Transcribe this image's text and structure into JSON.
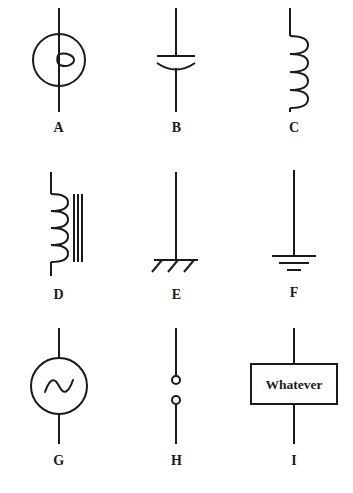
{
  "sheet": {
    "title": "Electrical schematic symbols reference sheet",
    "background_color": "#ffffff",
    "ink_color": "#1a1a1a",
    "stroke_width": 2,
    "columns": 3,
    "rows": 3
  },
  "symbols": [
    {
      "label": "A",
      "icon": "lamp-circle-symbol",
      "description": "Circle on a vertical lead with a small loop knot at center",
      "circle_radius": 26,
      "lead_top": 6,
      "lead_bottom": 106
    },
    {
      "label": "B",
      "icon": "polarized-capacitor-symbol",
      "description": "Vertical lead broken by one straight plate and one curved plate",
      "plate_width": 36,
      "gap": 7
    },
    {
      "label": "C",
      "icon": "inductor-coil-symbol",
      "description": "Vertical lead with four coil loops bulging to the right",
      "loops": 4
    },
    {
      "label": "D",
      "icon": "iron-core-inductor-symbol",
      "description": "Coil of four loops with three vertical core lines alongside",
      "loops": 4,
      "core_lines": 3
    },
    {
      "label": "E",
      "icon": "chassis-ground-symbol",
      "description": "Vertical lead ending in a horizontal bar with three slanted hatch strokes",
      "hatch_strokes": 3
    },
    {
      "label": "F",
      "icon": "earth-ground-symbol",
      "description": "Vertical lead ending in three stacked horizontal bars of decreasing width",
      "bars": 3
    },
    {
      "label": "G",
      "icon": "ac-source-symbol",
      "description": "Circle containing a sine wave on a vertical lead",
      "circle_radius": 28
    },
    {
      "label": "H",
      "icon": "open-terminals-symbol",
      "description": "Two vertical leads each ending in a small open circle with a gap between",
      "terminals": 2
    },
    {
      "label": "I",
      "icon": "generic-block-symbol",
      "description": "Rectangular block on a vertical lead containing a text label",
      "box_label": "Whatever"
    }
  ]
}
